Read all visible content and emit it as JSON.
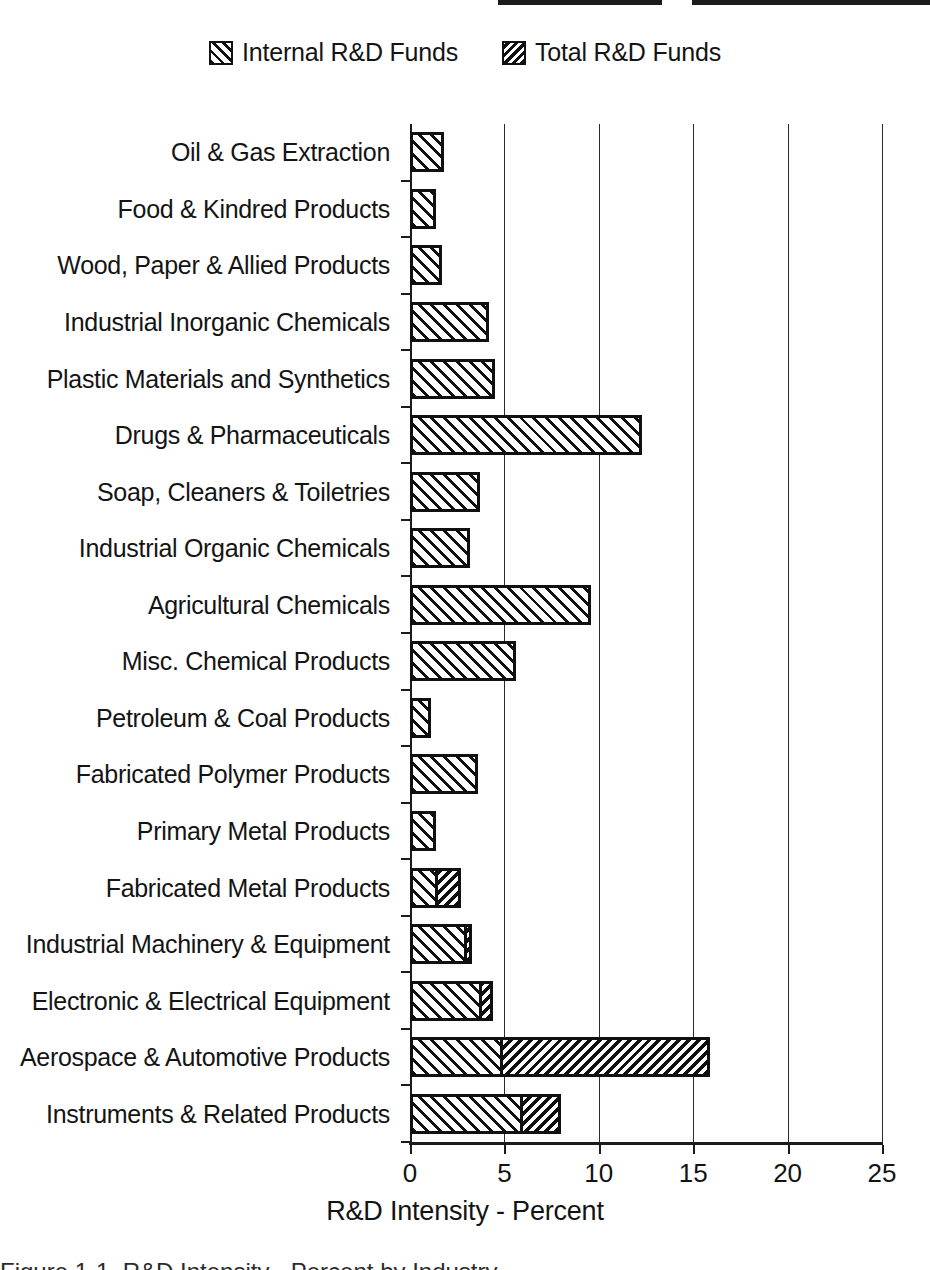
{
  "legend": {
    "entries": [
      {
        "label": "Internal R&D Funds",
        "pattern": "diagonal-up-right-wide",
        "swatch_name": "legend-swatch-internal"
      },
      {
        "label": "Total R&D Funds",
        "pattern": "diagonal-up-left-dense",
        "swatch_name": "legend-swatch-total"
      }
    ]
  },
  "axis": {
    "x_title": "R&D Intensity - Percent",
    "x_ticks": [
      "0",
      "5",
      "10",
      "15",
      "20",
      "25"
    ]
  },
  "caption": {
    "text": "Figure 1-1. R&D Intensity - Percent by Industry"
  },
  "chart_data": {
    "type": "bar",
    "orientation": "horizontal",
    "title": "",
    "xlabel": "R&D Intensity - Percent",
    "ylabel": "",
    "xlim": [
      0,
      25
    ],
    "xticks": [
      0,
      5,
      10,
      15,
      20,
      25
    ],
    "grid": "vertical-gridlines-at-xticks",
    "legend_position": "top-center",
    "categories": [
      "Oil & Gas Extraction",
      "Food & Kindred Products",
      "Wood, Paper & Allied Products",
      "Industrial Inorganic Chemicals",
      "Plastic Materials and Synthetics",
      "Drugs & Pharmaceuticals",
      "Soap, Cleaners & Toiletries",
      "Industrial Organic Chemicals",
      "Agricultural Chemicals",
      "Misc. Chemical Products",
      "Petroleum & Coal Products",
      "Fabricated Polymer Products",
      "Primary Metal Products",
      "Fabricated Metal Products",
      "Industrial Machinery & Equipment",
      "Electronic & Electrical Equipment",
      "Aerospace & Automotive Products",
      "Instruments & Related Products"
    ],
    "series": [
      {
        "name": "Internal R&D Funds",
        "values": [
          1.8,
          1.4,
          1.7,
          4.2,
          4.5,
          12.3,
          3.7,
          3.2,
          9.6,
          5.6,
          1.1,
          3.6,
          1.4,
          1.5,
          3.0,
          3.8,
          4.9,
          6.0
        ]
      },
      {
        "name": "Total R&D Funds",
        "values": [
          1.8,
          1.4,
          1.7,
          4.2,
          4.5,
          12.3,
          3.7,
          3.2,
          9.6,
          5.6,
          1.1,
          3.6,
          1.4,
          2.7,
          3.3,
          4.4,
          15.9,
          8.0
        ]
      }
    ]
  }
}
